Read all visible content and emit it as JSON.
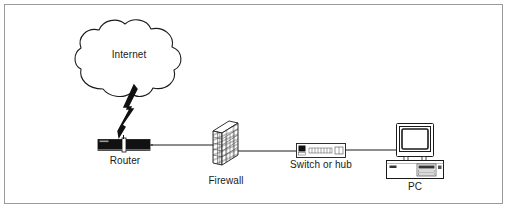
{
  "diagram": {
    "type": "network-topology",
    "title": "",
    "border_color": "#9a9a9a",
    "background_color": "#ffffff",
    "line_color": "#1a1a1a",
    "device_fill": "#1a1a1a",
    "nodes": [
      {
        "id": "internet",
        "label": "Internet",
        "icon": "cloud-icon"
      },
      {
        "id": "router",
        "label": "Router",
        "icon": "router-icon"
      },
      {
        "id": "firewall",
        "label": "Firewall",
        "icon": "brick-wall-icon"
      },
      {
        "id": "switch",
        "label": "Switch or hub",
        "icon": "switch-icon"
      },
      {
        "id": "pc",
        "label": "PC",
        "icon": "desktop-computer-icon"
      }
    ],
    "links": [
      {
        "from": "internet",
        "to": "router",
        "style": "lightning-bolt"
      },
      {
        "from": "router",
        "to": "firewall",
        "style": "line"
      },
      {
        "from": "firewall",
        "to": "switch",
        "style": "line"
      },
      {
        "from": "switch",
        "to": "pc",
        "style": "line"
      }
    ]
  }
}
